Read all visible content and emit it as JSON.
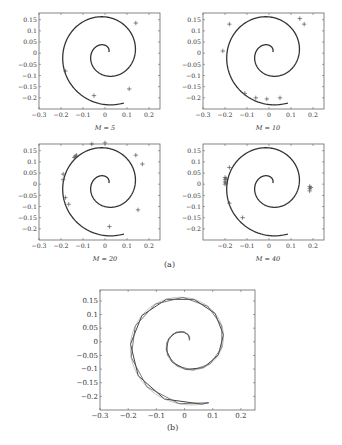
{
  "figure": {
    "caption_a": "(a)",
    "caption_b": "(b)"
  },
  "chart_data": [
    {
      "type": "scatter",
      "title": "M = 5",
      "xlabel": "M = 5",
      "xlim": [
        -0.3,
        0.25
      ],
      "ylim": [
        -0.25,
        0.18
      ],
      "xticks": [
        -0.3,
        -0.2,
        -0.1,
        0,
        0.1,
        0.2
      ],
      "yticks": [
        0.15,
        0.1,
        0.05,
        0,
        -0.05,
        -0.1,
        -0.15,
        -0.2
      ],
      "series": [
        {
          "name": "spiral",
          "kind": "line"
        },
        {
          "name": "samples",
          "kind": "markers",
          "marker": "+",
          "points": [
            [
              0.14,
              0.135
            ],
            [
              -0.18,
              -0.08
            ],
            [
              -0.05,
              -0.19
            ],
            [
              0.11,
              -0.16
            ]
          ]
        }
      ]
    },
    {
      "type": "scatter",
      "title": "M = 10",
      "xlabel": "M = 10",
      "xlim": [
        -0.3,
        0.25
      ],
      "ylim": [
        -0.25,
        0.18
      ],
      "xticks": [
        -0.3,
        -0.2,
        -0.1,
        0,
        0.1,
        0.2
      ],
      "yticks": [
        0.15,
        0.1,
        0.05,
        0,
        -0.05,
        -0.1,
        -0.15,
        -0.2
      ],
      "series": [
        {
          "name": "spiral",
          "kind": "line"
        },
        {
          "name": "samples",
          "kind": "markers",
          "marker": "+",
          "points": [
            [
              0.14,
              0.155
            ],
            [
              0.16,
              0.13
            ],
            [
              -0.21,
              0.01
            ],
            [
              -0.18,
              0.13
            ],
            [
              -0.11,
              -0.18
            ],
            [
              -0.06,
              -0.2
            ],
            [
              -0.01,
              -0.205
            ],
            [
              0.05,
              -0.2
            ]
          ]
        }
      ]
    },
    {
      "type": "scatter",
      "title": "M = 20",
      "xlabel": "M = 20",
      "xlim": [
        -0.3,
        0.25
      ],
      "ylim": [
        -0.25,
        0.18
      ],
      "xticks": [
        -0.3,
        -0.2,
        -0.1,
        0,
        0.1,
        0.2
      ],
      "yticks": [
        0.15,
        0.1,
        0.05,
        0,
        -0.05,
        -0.1,
        -0.15,
        -0.2
      ],
      "series": [
        {
          "name": "spiral",
          "kind": "line"
        },
        {
          "name": "samples",
          "kind": "markers",
          "marker": "+",
          "points": [
            [
              -0.14,
              0.12
            ],
            [
              -0.135,
              0.125
            ],
            [
              -0.13,
              0.13
            ],
            [
              -0.06,
              0.18
            ],
            [
              0.0,
              0.185
            ],
            [
              0.14,
              0.13
            ],
            [
              0.17,
              0.09
            ],
            [
              -0.19,
              0.045
            ],
            [
              -0.19,
              0.02
            ],
            [
              -0.18,
              -0.06
            ],
            [
              -0.165,
              -0.09
            ],
            [
              0.15,
              -0.115
            ],
            [
              0.02,
              -0.19
            ]
          ]
        }
      ]
    },
    {
      "type": "scatter",
      "title": "M = 40",
      "xlabel": "M = 40",
      "xlim": [
        -0.3,
        0.25
      ],
      "ylim": [
        -0.25,
        0.18
      ],
      "xticks": [
        -0.2,
        -0.1,
        0,
        0.1,
        0.2
      ],
      "yticks": [
        0.15,
        0.1,
        0.05,
        0,
        -0.05,
        -0.1,
        -0.15,
        -0.2
      ],
      "series": [
        {
          "name": "spiral",
          "kind": "line"
        },
        {
          "name": "samples",
          "kind": "markers",
          "marker": "+",
          "points": [
            [
              -0.2,
              0.03
            ],
            [
              -0.2,
              0.02
            ],
            [
              -0.2,
              0.01
            ],
            [
              -0.2,
              0.0
            ],
            [
              -0.195,
              0.025
            ],
            [
              -0.195,
              0.005
            ],
            [
              0.185,
              -0.01
            ],
            [
              0.185,
              -0.02
            ],
            [
              0.185,
              -0.03
            ],
            [
              0.19,
              -0.015
            ],
            [
              -0.18,
              0.075
            ],
            [
              -0.18,
              -0.085
            ],
            [
              -0.12,
              -0.15
            ]
          ]
        }
      ]
    },
    {
      "type": "line",
      "title": "(b)",
      "xlim": [
        -0.3,
        0.25
      ],
      "ylim": [
        -0.25,
        0.19
      ],
      "xticks": [
        -0.3,
        -0.2,
        -0.1,
        0,
        0.1,
        0.2
      ],
      "yticks": [
        0.15,
        0.1,
        0.05,
        0,
        -0.05,
        -0.1,
        -0.15,
        -0.2
      ],
      "series": [
        {
          "name": "spiral",
          "kind": "line"
        },
        {
          "name": "piecewise-approx-1",
          "kind": "polyline"
        },
        {
          "name": "piecewise-approx-2",
          "kind": "polyline"
        }
      ]
    }
  ]
}
